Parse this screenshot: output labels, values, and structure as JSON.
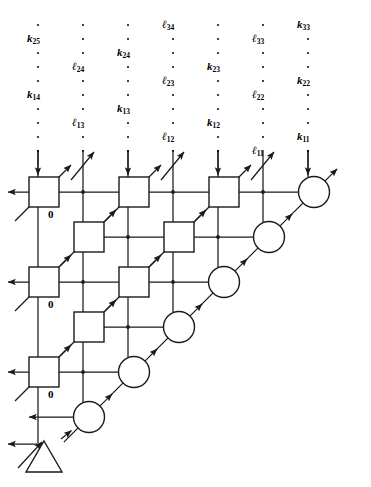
{
  "figure": {
    "kind": "systolic-array-diagram",
    "stroke_color": "#1a1a1a",
    "background": "#ffffff"
  },
  "input_columns": [
    {
      "index": 0,
      "x": 38,
      "arrow": "down",
      "labels": [
        {
          "base": "k",
          "sub": "25",
          "y": 33
        },
        {
          "base": "k",
          "sub": "14",
          "y": 89
        }
      ]
    },
    {
      "index": 1,
      "x": 83,
      "arrow": "diagonal-up",
      "labels": [
        {
          "base": "l",
          "sub": "24",
          "y": 61
        },
        {
          "base": "l",
          "sub": "13",
          "y": 117
        }
      ]
    },
    {
      "index": 2,
      "x": 128,
      "arrow": "down",
      "labels": [
        {
          "base": "k",
          "sub": "24",
          "y": 47
        },
        {
          "base": "k",
          "sub": "13",
          "y": 103
        }
      ]
    },
    {
      "index": 3,
      "x": 173,
      "arrow": "diagonal-up",
      "labels": [
        {
          "base": "l",
          "sub": "34",
          "y": 19
        },
        {
          "base": "l",
          "sub": "23",
          "y": 75
        },
        {
          "base": "l",
          "sub": "12",
          "y": 131
        }
      ]
    },
    {
      "index": 4,
      "x": 218,
      "arrow": "down",
      "labels": [
        {
          "base": "k",
          "sub": "23",
          "y": 61
        },
        {
          "base": "k",
          "sub": "12",
          "y": 117
        }
      ]
    },
    {
      "index": 5,
      "x": 263,
      "arrow": "diagonal-up",
      "labels": [
        {
          "base": "l",
          "sub": "33",
          "y": 33
        },
        {
          "base": "l",
          "sub": "22",
          "y": 89
        },
        {
          "base": "l",
          "sub": "11",
          "y": 145
        }
      ]
    },
    {
      "index": 6,
      "x": 308,
      "arrow": "down",
      "labels": [
        {
          "base": "k",
          "sub": "33",
          "y": 19
        },
        {
          "base": "k",
          "sub": "22",
          "y": 75
        },
        {
          "base": "k",
          "sub": "11",
          "y": 131
        }
      ]
    }
  ],
  "cells": {
    "square_label": "square-processing-cell",
    "circle_label": "circle-boundary-cell",
    "triangle_label": "triangle-output-cell",
    "squares": [
      {
        "row": 0,
        "col": 0,
        "cx": 44,
        "cy": 192
      },
      {
        "row": 0,
        "col": 1,
        "cx": 134,
        "cy": 192
      },
      {
        "row": 0,
        "col": 2,
        "cx": 224,
        "cy": 192
      },
      {
        "row": 1,
        "col": 0,
        "cx": 89,
        "cy": 237
      },
      {
        "row": 1,
        "col": 1,
        "cx": 179,
        "cy": 237
      },
      {
        "row": 2,
        "col": 0,
        "cx": 44,
        "cy": 282
      },
      {
        "row": 2,
        "col": 1,
        "cx": 134,
        "cy": 282
      },
      {
        "row": 3,
        "col": 0,
        "cx": 89,
        "cy": 327
      },
      {
        "row": 4,
        "col": 0,
        "cx": 44,
        "cy": 372
      }
    ],
    "circles": [
      {
        "cx": 314,
        "cy": 192
      },
      {
        "cx": 269,
        "cy": 237
      },
      {
        "cx": 224,
        "cy": 282
      },
      {
        "cx": 179,
        "cy": 327
      },
      {
        "cx": 134,
        "cy": 372
      },
      {
        "cx": 89,
        "cy": 417
      }
    ],
    "triangle": {
      "cx": 44,
      "cy": 458
    }
  },
  "zero_labels": [
    {
      "text": "0",
      "x": 48,
      "y": 208
    },
    {
      "text": "0",
      "x": 48,
      "y": 298
    },
    {
      "text": "0",
      "x": 48,
      "y": 388
    }
  ]
}
